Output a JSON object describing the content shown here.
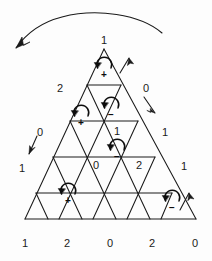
{
  "figure": {
    "line_color": "#1a1a1a",
    "background_color": "#fdfdfd",
    "rows": 5,
    "vertex_labels": [
      {
        "name": "apex",
        "text": "1",
        "x": 104,
        "y": 40
      },
      {
        "name": "row2-left",
        "text": "2",
        "x": 60,
        "y": 88
      },
      {
        "name": "row2-right",
        "text": "0",
        "x": 146,
        "y": 88
      },
      {
        "name": "row3-left",
        "text": "0",
        "x": 40,
        "y": 132
      },
      {
        "name": "row3-mid",
        "text": "1",
        "x": 117,
        "y": 131
      },
      {
        "name": "row3-right",
        "text": "1",
        "x": 165,
        "y": 132
      },
      {
        "name": "row4-left",
        "text": "1",
        "x": 22,
        "y": 168
      },
      {
        "name": "row4-mid-left",
        "text": "0",
        "x": 96,
        "y": 165
      },
      {
        "name": "row4-mid-right",
        "text": "2",
        "x": 139,
        "y": 165
      },
      {
        "name": "row4-right",
        "text": "1",
        "x": 184,
        "y": 166
      },
      {
        "name": "base-1",
        "text": "1",
        "x": 25,
        "y": 243
      },
      {
        "name": "base-2",
        "text": "2",
        "x": 67,
        "y": 243
      },
      {
        "name": "base-3",
        "text": "0",
        "x": 110,
        "y": 243
      },
      {
        "name": "base-4",
        "text": "2",
        "x": 152,
        "y": 243
      },
      {
        "name": "base-5",
        "text": "0",
        "x": 195,
        "y": 243
      }
    ],
    "cell_markers": [
      {
        "name": "cell-marker-row1-up",
        "sign": "+",
        "rotation": "counterclockwise",
        "cx": 104,
        "cy": 70
      },
      {
        "name": "cell-marker-row2-down",
        "sign": "−",
        "rotation": "counterclockwise",
        "cx": 111,
        "cy": 110
      },
      {
        "name": "cell-marker-row2-up-left",
        "sign": "+",
        "rotation": "counterclockwise",
        "cx": 81,
        "cy": 118
      },
      {
        "name": "cell-marker-row3-down",
        "sign": "−",
        "rotation": "counterclockwise",
        "cx": 117,
        "cy": 152
      },
      {
        "name": "cell-marker-row4-up-left",
        "sign": "+",
        "rotation": "counterclockwise",
        "cx": 68,
        "cy": 196
      },
      {
        "name": "cell-marker-row4-up-right",
        "sign": "−",
        "rotation": "counterclockwise",
        "cx": 172,
        "cy": 203
      }
    ],
    "edge_arrows": [
      {
        "name": "edge-arrow-top-right-up",
        "direction": "up-right"
      },
      {
        "name": "edge-arrow-right-down",
        "direction": "down-right"
      },
      {
        "name": "edge-arrow-left-down",
        "direction": "down-left"
      },
      {
        "name": "edge-arrow-bottom-right-up",
        "direction": "up-right"
      }
    ],
    "sweep_arrow": {
      "name": "sweep-arc-arrow",
      "description": "large arc sweeping right-to-left above the triangle",
      "direction": "counterclockwise"
    }
  }
}
